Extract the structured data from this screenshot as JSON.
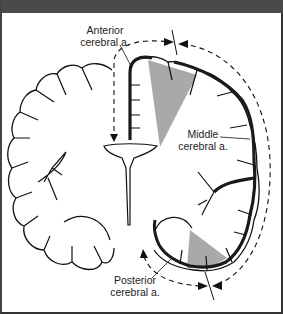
{
  "figure": {
    "labels": {
      "anterior": {
        "line1": "Anterior",
        "line2": "cerebral a."
      },
      "middle": {
        "line1": "Middle",
        "line2": "cerebral a."
      },
      "posterior": {
        "line1": "Posterior",
        "line2": "cerebral a."
      }
    },
    "colors": {
      "header_bar": "#4a4a4a",
      "outline": "#111111",
      "watershed_shading": "#9a9a9a",
      "artery": "#1a1a1a"
    }
  }
}
